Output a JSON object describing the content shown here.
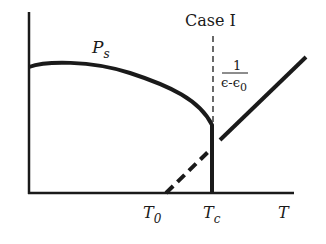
{
  "title": "Case I",
  "curve_label": "P",
  "curve_label_sub": "s",
  "frac_num": "1",
  "frac_den": "ϵ-ϵ",
  "frac_den_sub": "0",
  "x_axis_label": "T",
  "ticks": [
    {
      "label": "T",
      "sub": "0"
    },
    {
      "label": "T",
      "sub": "c"
    }
  ],
  "colors": {
    "line": "#1a1a1a",
    "background": "#ffffff"
  }
}
